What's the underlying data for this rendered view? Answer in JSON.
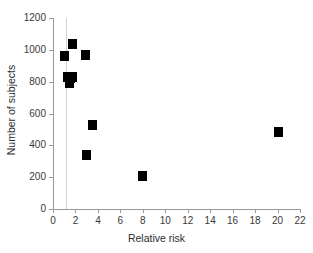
{
  "chart_data": {
    "type": "scatter",
    "title": "",
    "xlabel": "Relative risk",
    "ylabel": "Number of subjects",
    "xlim": [
      0,
      22
    ],
    "ylim": [
      0,
      1200
    ],
    "xticks": [
      0,
      2,
      4,
      6,
      8,
      10,
      12,
      14,
      16,
      18,
      20,
      22
    ],
    "yticks": [
      0,
      200,
      400,
      600,
      800,
      1000,
      1200
    ],
    "grid": false,
    "legend": null,
    "marker_style": "filled-square",
    "marker_color": "#000000",
    "reference_line": {
      "orientation": "vertical",
      "x": 1.15,
      "color": "#d2d2d2"
    },
    "points": [
      {
        "x": 1.7,
        "y": 1037
      },
      {
        "x": 1.0,
        "y": 960
      },
      {
        "x": 2.9,
        "y": 970
      },
      {
        "x": 1.25,
        "y": 830
      },
      {
        "x": 1.55,
        "y": 820
      },
      {
        "x": 1.75,
        "y": 830
      },
      {
        "x": 1.45,
        "y": 790
      },
      {
        "x": 3.5,
        "y": 525
      },
      {
        "x": 2.95,
        "y": 340
      },
      {
        "x": 8.0,
        "y": 210
      },
      {
        "x": 20.1,
        "y": 485
      }
    ]
  }
}
